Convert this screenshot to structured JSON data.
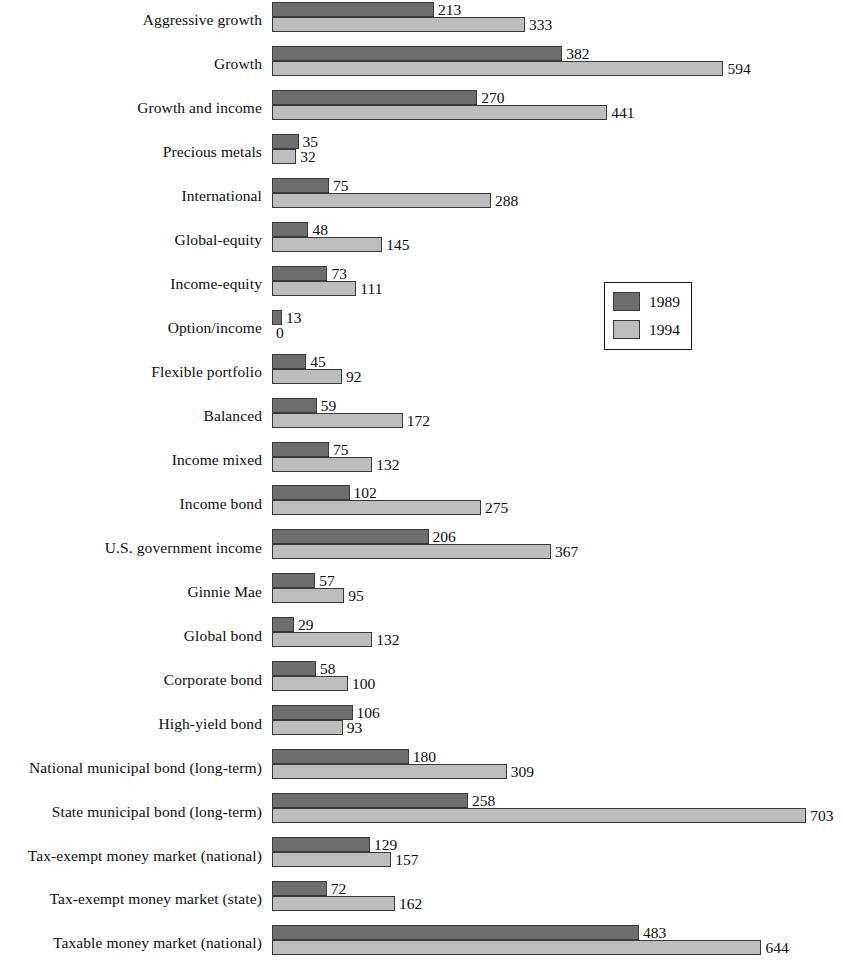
{
  "legend": {
    "position": "middle-right",
    "entries": [
      {
        "label": "1989",
        "color": "#6e6e6e"
      },
      {
        "label": "1994",
        "color": "#bdbdbd"
      }
    ]
  },
  "chart_data": {
    "type": "bar",
    "orientation": "horizontal",
    "title": "",
    "subtitle": "",
    "xlabel": "",
    "ylabel": "",
    "grid": false,
    "legend_position": "middle-right",
    "xlim": [
      0,
      703
    ],
    "value_labels": true,
    "categories": [
      "Aggressive growth",
      "Growth",
      "Growth and income",
      "Precious metals",
      "International",
      "Global-equity",
      "Income-equity",
      "Option/income",
      "Flexible portfolio",
      "Balanced",
      "Income mixed",
      "Income bond",
      "U.S. government income",
      "Ginnie Mae",
      "Global bond",
      "Corporate bond",
      "High-yield bond",
      "National municipal bond (long-term)",
      "State municipal bond (long-term)",
      "Tax-exempt money market (national)",
      "Tax-exempt money market (state)",
      "Taxable money market (national)"
    ],
    "series": [
      {
        "name": "1989",
        "color": "#6e6e6e",
        "values": [
          213,
          382,
          270,
          35,
          75,
          48,
          73,
          13,
          45,
          59,
          75,
          102,
          206,
          57,
          29,
          58,
          106,
          180,
          258,
          129,
          72,
          483
        ]
      },
      {
        "name": "1994",
        "color": "#bdbdbd",
        "values": [
          333,
          594,
          441,
          32,
          288,
          145,
          111,
          0,
          92,
          172,
          132,
          275,
          367,
          95,
          132,
          100,
          93,
          309,
          703,
          157,
          162,
          644
        ]
      }
    ]
  }
}
